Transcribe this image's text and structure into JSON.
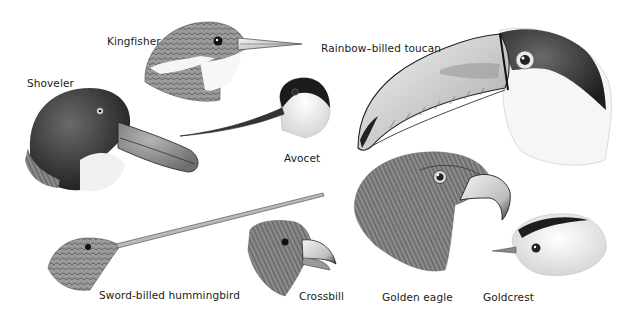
{
  "figure": {
    "style": "grayscale pencil drawing",
    "birds": [
      {
        "id": "kingfisher",
        "label": "Kingfisher",
        "label_pos": [
          107,
          35
        ]
      },
      {
        "id": "shoveler",
        "label": "Shoveler",
        "label_pos": [
          27,
          77
        ]
      },
      {
        "id": "avocet",
        "label": "Avocet",
        "label_pos": [
          284,
          152
        ]
      },
      {
        "id": "toucan",
        "label": "Rainbow–billed toucan",
        "label_pos": [
          321,
          42
        ]
      },
      {
        "id": "hummingbird",
        "label": "Sword-billed hummingbird",
        "label_pos": [
          99,
          289
        ]
      },
      {
        "id": "crossbill",
        "label": "Crossbill",
        "label_pos": [
          299,
          290
        ]
      },
      {
        "id": "golden-eagle",
        "label": "Golden eagle",
        "label_pos": [
          382,
          291
        ]
      },
      {
        "id": "goldcrest",
        "label": "Goldcrest",
        "label_pos": [
          483,
          291
        ]
      }
    ]
  }
}
